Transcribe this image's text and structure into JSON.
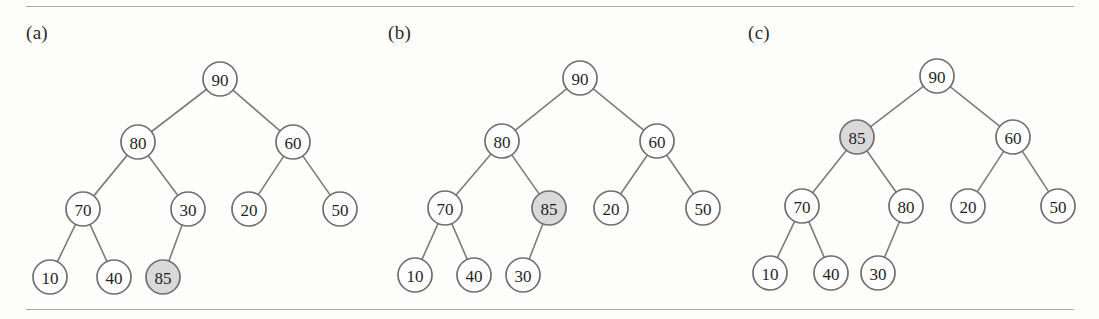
{
  "figure": {
    "width": 1099,
    "height": 319,
    "background_color": "#fdfdfc",
    "rule_color": "#8d8d8d",
    "node_fill": "#ffffff",
    "node_highlight_fill": "#d9d9d9",
    "node_stroke": "#6f6f6f",
    "edge_stroke": "#7c7c7c",
    "text_color": "#1f1f1f",
    "node_radius": 17
  },
  "panels": [
    {
      "id": "panel-a",
      "label": "(a)",
      "label_x": 26,
      "label_y": 22,
      "nodes": [
        {
          "id": "a-90",
          "value": "90",
          "x": 220,
          "y": 79,
          "highlight": false
        },
        {
          "id": "a-80",
          "value": "80",
          "x": 138,
          "y": 142,
          "highlight": false
        },
        {
          "id": "a-60",
          "value": "60",
          "x": 293,
          "y": 142,
          "highlight": false
        },
        {
          "id": "a-70",
          "value": "70",
          "x": 83,
          "y": 209,
          "highlight": false
        },
        {
          "id": "a-30",
          "value": "30",
          "x": 188,
          "y": 209,
          "highlight": false
        },
        {
          "id": "a-20",
          "value": "20",
          "x": 249,
          "y": 209,
          "highlight": false
        },
        {
          "id": "a-50",
          "value": "50",
          "x": 340,
          "y": 209,
          "highlight": false
        },
        {
          "id": "a-10",
          "value": "10",
          "x": 50,
          "y": 277,
          "highlight": false
        },
        {
          "id": "a-40",
          "value": "40",
          "x": 114,
          "y": 277,
          "highlight": false
        },
        {
          "id": "a-85",
          "value": "85",
          "x": 163,
          "y": 277,
          "highlight": true
        }
      ],
      "edges": [
        {
          "from": "a-90",
          "to": "a-80"
        },
        {
          "from": "a-90",
          "to": "a-60"
        },
        {
          "from": "a-80",
          "to": "a-70"
        },
        {
          "from": "a-80",
          "to": "a-30"
        },
        {
          "from": "a-60",
          "to": "a-20"
        },
        {
          "from": "a-60",
          "to": "a-50"
        },
        {
          "from": "a-70",
          "to": "a-10"
        },
        {
          "from": "a-70",
          "to": "a-40"
        },
        {
          "from": "a-30",
          "to": "a-85"
        }
      ]
    },
    {
      "id": "panel-b",
      "label": "(b)",
      "label_x": 388,
      "label_y": 22,
      "nodes": [
        {
          "id": "b-90",
          "value": "90",
          "x": 580,
          "y": 78,
          "highlight": false
        },
        {
          "id": "b-80",
          "value": "80",
          "x": 502,
          "y": 141,
          "highlight": false
        },
        {
          "id": "b-60",
          "value": "60",
          "x": 657,
          "y": 141,
          "highlight": false
        },
        {
          "id": "b-70",
          "value": "70",
          "x": 445,
          "y": 208,
          "highlight": false
        },
        {
          "id": "b-85",
          "value": "85",
          "x": 549,
          "y": 208,
          "highlight": true
        },
        {
          "id": "b-20",
          "value": "20",
          "x": 611,
          "y": 208,
          "highlight": false
        },
        {
          "id": "b-50",
          "value": "50",
          "x": 703,
          "y": 208,
          "highlight": false
        },
        {
          "id": "b-10",
          "value": "10",
          "x": 415,
          "y": 275,
          "highlight": false
        },
        {
          "id": "b-40",
          "value": "40",
          "x": 474,
          "y": 275,
          "highlight": false
        },
        {
          "id": "b-30",
          "value": "30",
          "x": 523,
          "y": 275,
          "highlight": false
        }
      ],
      "edges": [
        {
          "from": "b-90",
          "to": "b-80"
        },
        {
          "from": "b-90",
          "to": "b-60"
        },
        {
          "from": "b-80",
          "to": "b-70"
        },
        {
          "from": "b-80",
          "to": "b-85"
        },
        {
          "from": "b-60",
          "to": "b-20"
        },
        {
          "from": "b-60",
          "to": "b-50"
        },
        {
          "from": "b-70",
          "to": "b-10"
        },
        {
          "from": "b-70",
          "to": "b-40"
        },
        {
          "from": "b-85",
          "to": "b-30"
        }
      ]
    },
    {
      "id": "panel-c",
      "label": "(c)",
      "label_x": 748,
      "label_y": 22,
      "nodes": [
        {
          "id": "c-90",
          "value": "90",
          "x": 937,
          "y": 76,
          "highlight": false
        },
        {
          "id": "c-85",
          "value": "85",
          "x": 857,
          "y": 137,
          "highlight": true
        },
        {
          "id": "c-60",
          "value": "60",
          "x": 1013,
          "y": 137,
          "highlight": false
        },
        {
          "id": "c-70",
          "value": "70",
          "x": 802,
          "y": 206,
          "highlight": false
        },
        {
          "id": "c-80",
          "value": "80",
          "x": 906,
          "y": 206,
          "highlight": false
        },
        {
          "id": "c-20",
          "value": "20",
          "x": 968,
          "y": 206,
          "highlight": false
        },
        {
          "id": "c-50",
          "value": "50",
          "x": 1058,
          "y": 206,
          "highlight": false
        },
        {
          "id": "c-10",
          "value": "10",
          "x": 770,
          "y": 273,
          "highlight": false
        },
        {
          "id": "c-40",
          "value": "40",
          "x": 831,
          "y": 273,
          "highlight": false
        },
        {
          "id": "c-30",
          "value": "30",
          "x": 878,
          "y": 273,
          "highlight": false
        }
      ],
      "edges": [
        {
          "from": "c-90",
          "to": "c-85"
        },
        {
          "from": "c-90",
          "to": "c-60"
        },
        {
          "from": "c-85",
          "to": "c-70"
        },
        {
          "from": "c-85",
          "to": "c-80"
        },
        {
          "from": "c-60",
          "to": "c-20"
        },
        {
          "from": "c-60",
          "to": "c-50"
        },
        {
          "from": "c-70",
          "to": "c-10"
        },
        {
          "from": "c-70",
          "to": "c-40"
        },
        {
          "from": "c-80",
          "to": "c-30"
        }
      ]
    }
  ]
}
